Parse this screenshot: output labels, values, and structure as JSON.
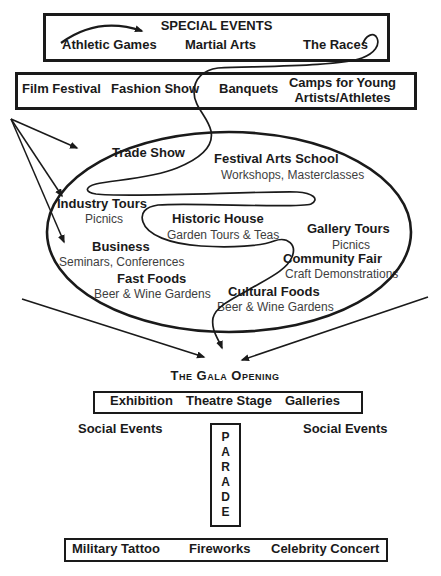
{
  "colors": {
    "ink": "#1a1a1a",
    "subtitle_text": "#3e3e3e",
    "background": "#ffffff"
  },
  "special_events_box": {
    "title": "SPECIAL EVENTS",
    "items": [
      {
        "label": "Athletic Games"
      },
      {
        "label": "Martial Arts"
      },
      {
        "label": "The Races"
      }
    ]
  },
  "row2_box": {
    "items": [
      {
        "label": "Film Festival"
      },
      {
        "label": "Fashion Show"
      },
      {
        "label": "Banquets"
      },
      {
        "label": "Camps for Young Artists/Athletes",
        "line1": "Camps for Young",
        "line2": "Artists/Athletes"
      }
    ]
  },
  "ellipse_items": [
    {
      "title": "Trade Show",
      "subtitle": ""
    },
    {
      "title": "Festival Arts School",
      "subtitle": "Workshops, Masterclasses"
    },
    {
      "title": "Industry Tours",
      "subtitle": "Picnics"
    },
    {
      "title": "Historic House",
      "subtitle": "Garden Tours & Teas"
    },
    {
      "title": "Gallery Tours",
      "subtitle": "Picnics"
    },
    {
      "title": "Business",
      "subtitle": "Seminars, Conferences"
    },
    {
      "title": "Community Fair",
      "subtitle": "Craft Demonstrations"
    },
    {
      "title": "Fast Foods",
      "subtitle": "Beer & Wine Gardens"
    },
    {
      "title": "Cultural Foods",
      "subtitle": "Beer & Wine Gardens"
    }
  ],
  "gala": {
    "label": "The Gala Opening"
  },
  "venues_box": {
    "items": [
      {
        "label": "Exhibition"
      },
      {
        "label": "Theatre Stage"
      },
      {
        "label": "Galleries"
      }
    ]
  },
  "social_events": {
    "left_label": "Social Events",
    "right_label": "Social Events"
  },
  "parade": {
    "word": "PARADE",
    "letters": [
      "P",
      "A",
      "R",
      "A",
      "D",
      "E"
    ]
  },
  "finale_box": {
    "items": [
      {
        "label": "Military Tattoo"
      },
      {
        "label": "Fireworks"
      },
      {
        "label": "Celebrity Concert"
      }
    ]
  }
}
